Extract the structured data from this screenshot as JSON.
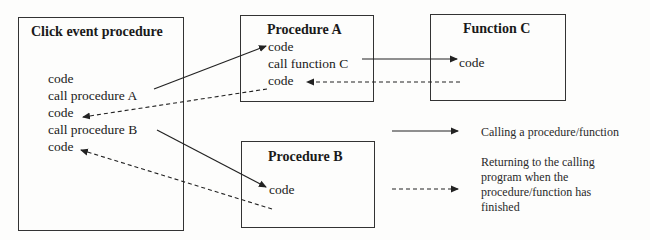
{
  "click_event": {
    "title": "Click event procedure",
    "lines": [
      "code",
      "call procedure A",
      "code",
      "call procedure B",
      "code"
    ]
  },
  "procedure_a": {
    "title": "Procedure A",
    "lines": [
      "code",
      "call function C",
      "code"
    ]
  },
  "function_c": {
    "title": "Function C",
    "lines": [
      "code"
    ]
  },
  "procedure_b": {
    "title": "Procedure B",
    "lines": [
      "code"
    ]
  },
  "legend": {
    "call": "Calling a procedure/function",
    "return_lines": [
      "Returning to the calling",
      "program when the",
      "procedure/function has",
      "finished"
    ]
  },
  "colors": {
    "line": "#222222",
    "border": "#333333",
    "background": "#fdfdfc"
  }
}
